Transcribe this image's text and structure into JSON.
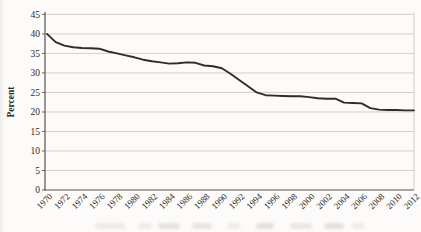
{
  "chart_data": {
    "type": "line",
    "title": "",
    "xlabel": "",
    "ylabel": "Percent",
    "x": [
      1970,
      1971,
      1972,
      1973,
      1974,
      1975,
      1976,
      1977,
      1978,
      1979,
      1980,
      1981,
      1982,
      1983,
      1984,
      1985,
      1986,
      1987,
      1988,
      1989,
      1990,
      1991,
      1992,
      1993,
      1994,
      1995,
      1996,
      1997,
      1998,
      1999,
      2000,
      2001,
      2002,
      2003,
      2004,
      2005,
      2006,
      2007,
      2008,
      2009,
      2010,
      2011,
      2012
    ],
    "series": [
      {
        "name": "percent",
        "values": [
          40.0,
          37.9,
          37.0,
          36.6,
          36.4,
          36.3,
          36.2,
          35.5,
          35.0,
          34.5,
          34.0,
          33.4,
          33.0,
          32.7,
          32.4,
          32.5,
          32.7,
          32.6,
          31.9,
          31.7,
          31.2,
          29.8,
          28.2,
          26.6,
          25.0,
          24.3,
          24.2,
          24.1,
          24.0,
          24.0,
          23.8,
          23.5,
          23.4,
          23.4,
          22.4,
          22.3,
          22.2,
          21.0,
          20.6,
          20.5,
          20.5,
          20.4,
          20.4
        ]
      }
    ],
    "ylim": [
      0,
      45
    ],
    "yticks": [
      0,
      5,
      10,
      15,
      20,
      25,
      30,
      35,
      40,
      45
    ],
    "xtick_labels": [
      "1970",
      "1972",
      "1974",
      "1976",
      "1978",
      "1980",
      "1982",
      "1984",
      "1986",
      "1988",
      "1990",
      "1992",
      "1994",
      "1996",
      "1998",
      "2000",
      "2002",
      "2004",
      "2006",
      "2008",
      "2010",
      "2012"
    ],
    "grid": "horizontal",
    "legend": "none",
    "colors": {
      "line": "#2e2d2b",
      "grid": "#c9c7c1",
      "axis": "#5a5750",
      "plot_right_border": "#c9c7c1",
      "label": "#2e2c29",
      "background": "#fcfbf9"
    }
  }
}
